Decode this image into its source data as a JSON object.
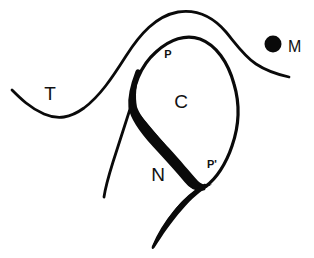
{
  "figure": {
    "background_color": "#ffffff",
    "ink_color": "#0a0a0a",
    "width": 314,
    "height": 258
  },
  "labels": {
    "t": {
      "text": "T",
      "x": 50,
      "y": 100,
      "style": "plain",
      "description": "label on the left of the long upper sweeping curve"
    },
    "p": {
      "text": "P",
      "x": 168,
      "y": 58,
      "style": "bold",
      "description": "bold label near the top of the enclosed blob"
    },
    "c": {
      "text": "C",
      "x": 181,
      "y": 108,
      "style": "plain",
      "description": "label inside the enclosed blob"
    },
    "n": {
      "text": "N",
      "x": 158,
      "y": 181,
      "style": "plain",
      "description": "label in the lower open region"
    },
    "p_prime": {
      "text": "P'",
      "x": 212,
      "y": 168,
      "style": "bold",
      "description": "bold label near the lower notch of the blob"
    },
    "m": {
      "text": "M",
      "x": 288,
      "y": 52,
      "style": "marker",
      "description": "label to the right of the solid filled dot"
    }
  },
  "marker_dot": {
    "name": "solid-round-marker",
    "cx": 273,
    "cy": 44,
    "r": 8.5,
    "color": "#0a0a0a"
  },
  "strokes": [
    {
      "name": "upper-sweeping-curve",
      "stroke_width": 3,
      "description": "Long S-shaped curve running from the lower left, rising over the top of the blob and descending to the right edge near the marker dot"
    },
    {
      "name": "blob-outline",
      "stroke_width": 3,
      "description": "Closed rounded blob enclosing region C, with a thickened left border and a notch at P'"
    },
    {
      "name": "blob-left-thick-edge",
      "stroke_width": 7,
      "description": "Heavy tapered stroke along the left and lower-left boundary of the blob"
    },
    {
      "name": "lower-left-branch",
      "stroke_width": 3,
      "description": "Short curve descending from the blob junction toward the lower left"
    },
    {
      "name": "lower-tail",
      "stroke_width": 4,
      "description": "Tapered stroke descending from the P' notch toward the bottom of the frame"
    }
  ]
}
